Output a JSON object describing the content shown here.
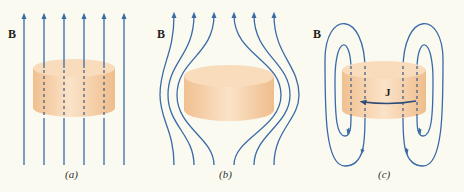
{
  "colors": {
    "background": "#fbfaf0",
    "field_line": "#3a6aa8",
    "cylinder_side": "#f3c89c",
    "cylinder_top": "#f8dcbc",
    "label": "#222222"
  },
  "panels": [
    {
      "id": "a",
      "field_label": "B",
      "caption": "(a)",
      "description": "Uniform field lines passing straight through cylinder"
    },
    {
      "id": "b",
      "field_label": "B",
      "caption": "(b)",
      "description": "Field lines expelled, bending around cylinder"
    },
    {
      "id": "c",
      "field_label": "B",
      "caption": "(c)",
      "current_label": "J",
      "description": "Closed loop field lines produced by circulating current J"
    }
  ]
}
